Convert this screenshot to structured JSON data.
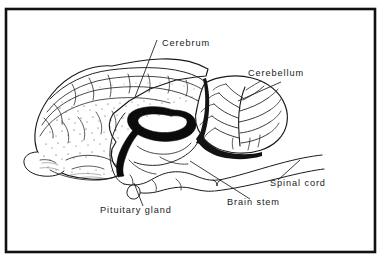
{
  "figure": {
    "kind": "anatomical-line-drawing",
    "orientation": "left-facing lateral / mid-sagittal view",
    "border_color": "#111111",
    "background_color": "#ffffff",
    "ink_color": "#1a1a1a",
    "label_color": "#1a1a1a"
  },
  "labels": [
    {
      "id": "cerebrum",
      "text": "Cerebrum",
      "x": 162,
      "y": 46,
      "anchor": "start",
      "leader": {
        "x1": 157,
        "y1": 40,
        "x2": 135,
        "y2": 97
      }
    },
    {
      "id": "cerebellum",
      "text": "Cerebellum",
      "x": 248,
      "y": 76,
      "anchor": "start",
      "leader": {
        "x1": 281,
        "y1": 82,
        "x2": 238,
        "y2": 101
      }
    },
    {
      "id": "spinal-cord",
      "text": "Spinal cord",
      "x": 270,
      "y": 186,
      "anchor": "start",
      "leader": {
        "x1": 300,
        "y1": 160,
        "x2": 278,
        "y2": 180
      }
    },
    {
      "id": "brain-stem",
      "text": "Brain stem",
      "x": 227,
      "y": 205,
      "anchor": "start",
      "leader": {
        "x1": 250,
        "y1": 199,
        "x2": 190,
        "y2": 161
      }
    },
    {
      "id": "pituitary-gland",
      "text": "Pituitary gland",
      "x": 100,
      "y": 213,
      "anchor": "start",
      "leader": {
        "x1": 143,
        "y1": 206,
        "x2": 134,
        "y2": 183
      }
    }
  ],
  "caption": {
    "text": "",
    "visible": false,
    "note": "bottom caption line is cropped off the image"
  },
  "structures": [
    {
      "id": "cerebral-cortex",
      "name": "Cerebral cortex (gyri and sulci, stippled)"
    },
    {
      "id": "corpus-callosum",
      "name": "Corpus callosum (solid black curved band)"
    },
    {
      "id": "cerebellum-arbor-vitae",
      "name": "Cerebellum with arbor vitae branching"
    },
    {
      "id": "brain-stem-body",
      "name": "Brain stem"
    },
    {
      "id": "pituitary-body",
      "name": "Pituitary gland"
    },
    {
      "id": "spinal-cord-body",
      "name": "Spinal cord"
    },
    {
      "id": "temporal-lobe",
      "name": "Temporal lobe"
    }
  ]
}
